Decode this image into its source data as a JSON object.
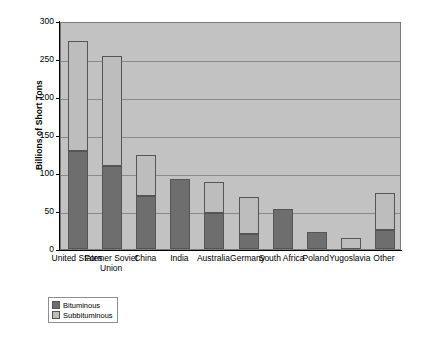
{
  "chart_data": {
    "type": "bar",
    "subtype": "stacked-vertical",
    "title": "",
    "xlabel": "",
    "ylabel": "Billions of Short Tons",
    "ylim": [
      0,
      300
    ],
    "ytick_labels": [
      "300",
      "250",
      "200",
      "150",
      "100",
      "50",
      "0"
    ],
    "ytick_values": [
      300,
      250,
      200,
      150,
      100,
      50,
      0
    ],
    "grid": true,
    "grid_axis": "y",
    "legend_position": "below-left",
    "categories": [
      "United States",
      "Former Soviet Union",
      "China",
      "India",
      "Australia",
      "Germany",
      "South Africa",
      "Poland",
      "Yugoslavia",
      "Other"
    ],
    "series": [
      {
        "name": "Bituminous",
        "color": "#6e6e6e",
        "values": [
          129,
          109,
          70,
          92,
          47,
          20,
          52,
          22,
          0,
          25
        ]
      },
      {
        "name": "Subbituminous",
        "color": "#bdbdbd",
        "values": [
          145,
          145,
          54,
          0,
          41,
          49,
          0,
          0,
          15,
          49
        ]
      }
    ],
    "totals": [
      274,
      254,
      124,
      92,
      88,
      69,
      52,
      22,
      15,
      74
    ]
  },
  "legend": {
    "items": [
      {
        "label": "Bituminous",
        "swatch": "bituminous"
      },
      {
        "label": "Subbituminous",
        "swatch": "subbituminous"
      }
    ]
  },
  "colors": {
    "bituminous": "#6e6e6e",
    "subbituminous": "#bdbdbd",
    "plot_background": "#c2c2c2",
    "gridline": "#8a8a8a",
    "axis": "#000000",
    "page_background": "#ffffff"
  }
}
